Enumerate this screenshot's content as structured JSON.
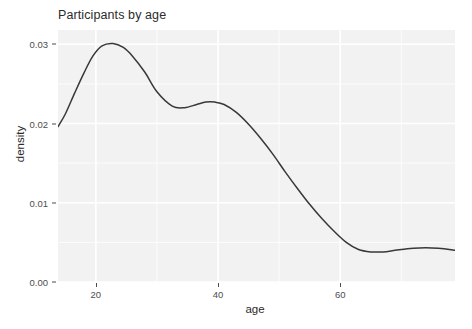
{
  "chart_data": {
    "type": "line",
    "title": "Participants by age",
    "xlabel": "age",
    "ylabel": "density",
    "xlim": [
      13.8,
      78.8
    ],
    "ylim": [
      0.0,
      0.0318
    ],
    "xticks": [
      20,
      40,
      60
    ],
    "xtick_labels": [
      "20",
      "40",
      "60"
    ],
    "yticks": [
      0.0,
      0.01,
      0.02,
      0.03
    ],
    "ytick_labels": [
      "0.00",
      "0.01",
      "0.02",
      "0.03"
    ],
    "grid": true,
    "grid_color": "#ffffff",
    "panel_color": "#f2f2f2",
    "line_color": "#38383b",
    "legend": "none",
    "series": [
      {
        "name": "density",
        "x": [
          13.8,
          15.0,
          16.5,
          18.0,
          19.5,
          21.0,
          22.8,
          24.5,
          26.0,
          28.0,
          30.0,
          32.5,
          34.5,
          36.5,
          38.0,
          39.5,
          41.0,
          43.0,
          45.0,
          47.0,
          49.0,
          51.0,
          53.0,
          55.0,
          57.0,
          59.0,
          61.0,
          63.0,
          65.0,
          67.0,
          69.0,
          71.0,
          73.0,
          75.0,
          77.0,
          78.8
        ],
        "y": [
          0.0196,
          0.0212,
          0.0238,
          0.0263,
          0.0285,
          0.0298,
          0.0301,
          0.0296,
          0.0285,
          0.0265,
          0.024,
          0.0222,
          0.022,
          0.0224,
          0.0227,
          0.0227,
          0.0224,
          0.0214,
          0.0199,
          0.0181,
          0.0161,
          0.0139,
          0.0118,
          0.0098,
          0.008,
          0.0064,
          0.005,
          0.0041,
          0.0038,
          0.0038,
          0.004,
          0.0042,
          0.0043,
          0.0043,
          0.0042,
          0.004
        ]
      }
    ]
  }
}
